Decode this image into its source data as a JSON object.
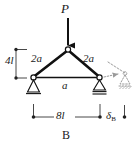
{
  "figure": {
    "caption": "B",
    "type": "structural-truss-diagram"
  },
  "labels": {
    "load": "P",
    "height_dimension": "4l",
    "member_left": "2a",
    "member_right": "2a",
    "member_bottom": "a",
    "span_dimension": "8l",
    "deflection_symbol": "δ",
    "deflection_subscript": "B",
    "deflection_full": "δB"
  },
  "geometry": {
    "apex": {
      "x": 68,
      "y": 50
    },
    "left_node": {
      "x": 33,
      "y": 77
    },
    "right_node": {
      "x": 100,
      "y": 77
    },
    "deflected_node": {
      "x": 124,
      "y": 72
    },
    "load_arrow": {
      "x": 68,
      "y_start": 18,
      "y_end": 46
    },
    "height_dim_line": {
      "x": 16,
      "y_top": 49,
      "y_bottom": 78
    },
    "span_dim_line": {
      "y": 117,
      "x_left": 33,
      "x_right": 100
    },
    "deflection_dim_line": {
      "y": 117,
      "x_left": 100,
      "x_right": 124
    }
  },
  "colors": {
    "ink": "#1a1a1a",
    "member": "#111111",
    "ghost": "#8a8a8a",
    "background": "#ffffff",
    "node_fill": "#ffffff"
  },
  "supports": {
    "left": {
      "kind": "pin-support",
      "node": "A"
    },
    "right": {
      "kind": "roller-support",
      "node": "B"
    }
  }
}
